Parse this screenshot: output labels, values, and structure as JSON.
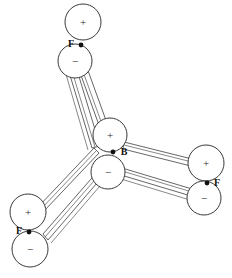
{
  "figure": {
    "background_color": "#ffffff",
    "stroke_color": "#3a3a3a",
    "nucleus_color": "#111111",
    "label_color": "#2a2a2a"
  },
  "glyphs": {
    "plus": "+",
    "minus": "−"
  },
  "atoms": [
    {
      "id": "boron-center",
      "element_label": "B",
      "label_x": 124,
      "label_y": 152,
      "nucleus_x": 113,
      "nucleus_y": 152,
      "positive": {
        "cx": 110,
        "cy": 135,
        "r": 17,
        "sign": "+",
        "sign_x": 110,
        "sign_y": 135
      },
      "negative": {
        "cx": 108,
        "cy": 172,
        "r": 17,
        "sign": "−",
        "sign_x": 108,
        "sign_y": 172
      }
    },
    {
      "id": "fluorine-top",
      "element_label": "F",
      "label_x": 71,
      "label_y": 44,
      "nucleus_x": 81,
      "nucleus_y": 45,
      "positive": {
        "cx": 83,
        "cy": 22,
        "r": 18,
        "sign": "+",
        "sign_x": 83,
        "sign_y": 22
      },
      "negative": {
        "cx": 75,
        "cy": 61,
        "r": 17,
        "sign": "−",
        "sign_x": 75,
        "sign_y": 61
      }
    },
    {
      "id": "fluorine-right",
      "element_label": "F",
      "label_x": 217,
      "label_y": 184,
      "nucleus_x": 207,
      "nucleus_y": 183,
      "positive": {
        "cx": 206,
        "cy": 163,
        "r": 18,
        "sign": "+",
        "sign_x": 206,
        "sign_y": 163
      },
      "negative": {
        "cx": 204,
        "cy": 198,
        "r": 17,
        "sign": "−",
        "sign_x": 204,
        "sign_y": 198
      }
    },
    {
      "id": "fluorine-lower-left",
      "element_label": "F",
      "label_x": 19,
      "label_y": 232,
      "nucleus_x": 29,
      "nucleus_y": 232,
      "positive": {
        "cx": 28,
        "cy": 212,
        "r": 18,
        "sign": "+",
        "sign_x": 28,
        "sign_y": 212
      },
      "negative": {
        "cx": 30,
        "cy": 249,
        "r": 18,
        "sign": "−",
        "sign_x": 30,
        "sign_y": 249
      }
    }
  ],
  "bonds": [
    {
      "id": "bond-b-f-top",
      "from": "boron-center",
      "to": "fluorine-top"
    },
    {
      "id": "bond-b-f-right",
      "from": "boron-center",
      "to": "fluorine-right"
    },
    {
      "id": "bond-b-f-lower-left",
      "from": "boron-center",
      "to": "fluorine-lower-left"
    }
  ]
}
